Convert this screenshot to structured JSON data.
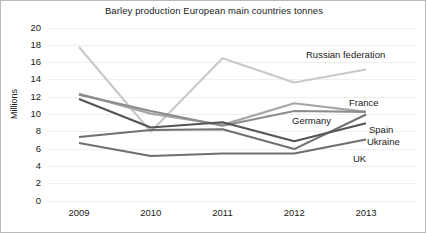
{
  "chart_data": {
    "type": "line",
    "title": "Barley production European main countries tonnes",
    "xlabel": "",
    "ylabel": "Millions",
    "x": [
      "2009",
      "2010",
      "2011",
      "2012",
      "2013"
    ],
    "categories": [
      "2009",
      "2010",
      "2011",
      "2012",
      "2013"
    ],
    "ylim": [
      0,
      20
    ],
    "yticks": [
      0,
      2,
      4,
      6,
      8,
      10,
      12,
      14,
      16,
      18,
      20
    ],
    "grid": true,
    "legend_position": "inline-right-labels",
    "series": [
      {
        "name": "Russian federation",
        "color": "#c9c9c9",
        "values": [
          17.8,
          8.0,
          16.5,
          13.7,
          15.2
        ],
        "label_x": 305,
        "label_y": 48
      },
      {
        "name": "France",
        "color": "#a6a6a6",
        "values": [
          12.4,
          10.1,
          8.8,
          11.3,
          10.3
        ],
        "label_x": 348,
        "label_y": 96
      },
      {
        "name": "Germany",
        "color": "#8c8c8c",
        "values": [
          12.3,
          10.4,
          8.7,
          10.4,
          10.3
        ],
        "label_x": 291,
        "label_y": 114
      },
      {
        "name": "Spain",
        "color": "#707070",
        "values": [
          7.4,
          8.2,
          8.3,
          6.0,
          10.0
        ],
        "label_x": 368,
        "label_y": 123
      },
      {
        "name": "Ukraine",
        "color": "#545454",
        "values": [
          11.8,
          8.5,
          9.1,
          6.9,
          9.0
        ],
        "label_x": 366,
        "label_y": 135
      },
      {
        "name": "UK",
        "color": "#6e6e6e",
        "values": [
          6.7,
          5.2,
          5.5,
          5.5,
          7.1
        ],
        "label_x": 352,
        "label_y": 152
      }
    ]
  }
}
